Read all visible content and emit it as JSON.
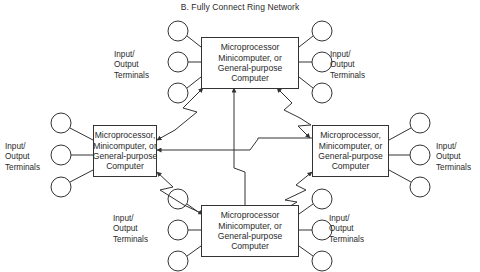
{
  "title": "B.  Fully Connect Ring Network",
  "nodes": {
    "top": {
      "lines": [
        "Microprocessor",
        "Minicomputer, or",
        "General-purpose",
        "Computer"
      ]
    },
    "left": {
      "lines": [
        "Microprocessor,",
        "Minicomputer, or",
        "General-purpose",
        "Computer"
      ]
    },
    "right": {
      "lines": [
        "Microprocessor,",
        "Minicomputer, or",
        "General-purpose",
        "Computer"
      ]
    },
    "bottom": {
      "lines": [
        "Microprocessor",
        "Minicomputer, or",
        "General-purpose",
        "Computer"
      ]
    }
  },
  "io_labels": {
    "top_left": [
      "Input/",
      "Output",
      "Terminals"
    ],
    "top_right": [
      "Input/",
      "Output",
      "Terminals"
    ],
    "left": [
      "Input/",
      "Output",
      "Terminals"
    ],
    "right": [
      "Input/",
      "Output",
      "Terminals"
    ],
    "bottom_left": [
      "Input/",
      "Output",
      "Terminals"
    ],
    "bottom_right": [
      "Input/",
      "Output",
      "Terminals"
    ]
  },
  "colors": {
    "line": "#333333",
    "text": "#2a2a2a",
    "background": "#ffffff"
  }
}
